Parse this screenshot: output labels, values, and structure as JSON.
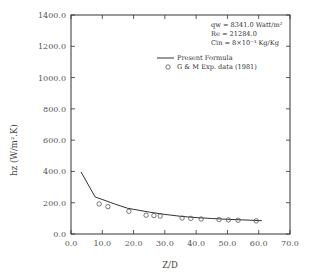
{
  "chart_data": {
    "type": "line",
    "title": "",
    "xlabel": "Z/D",
    "ylabel": "hz (W/m².K)",
    "xlim": [
      0,
      70
    ],
    "ylim": [
      0,
      1400
    ],
    "grid": false,
    "x_ticks": [
      "0.0",
      "10.0",
      "20.0",
      "30.0",
      "40.0",
      "50.0",
      "60.0",
      "70.0"
    ],
    "y_ticks": [
      "0.0",
      "200.0",
      "400.0",
      "600.0",
      "800.0",
      "1000.0",
      "1200.0",
      "1400.0"
    ],
    "legend_position": "upper right",
    "annotations": [
      {
        "name": "qw",
        "text": "qw  =  8341.0  Watt/m²"
      },
      {
        "name": "Re",
        "text": "Re  =  21284.0"
      },
      {
        "name": "Cin",
        "text": "Cin  =  8×10⁻³  Kg/Kg"
      }
    ],
    "series": [
      {
        "name": "Present Formula",
        "style": "line",
        "x": [
          3.2,
          7.7,
          14,
          18,
          25,
          30,
          35,
          40,
          45,
          50,
          55,
          61
        ],
        "y": [
          397,
          237,
          192,
          165,
          140,
          125,
          113,
          105,
          99,
          94,
          90,
          85
        ]
      },
      {
        "name": "G & M Exp. data (1981)",
        "style": "marker-circle-open",
        "x": [
          9,
          11.8,
          18.5,
          24,
          26.5,
          28.5,
          35.5,
          38.3,
          41.6,
          47.3,
          50.3,
          53.4,
          59.2
        ],
        "y": [
          192,
          175,
          145,
          120,
          118,
          115,
          102,
          100,
          96,
          92,
          90,
          88,
          84
        ]
      }
    ]
  },
  "legend": {
    "line_label": "Present Formula",
    "marker_label": "G & M Exp. data (1981)",
    "qw_text": "qw  =  8341.0  Watt/m²",
    "re_text": "Re  =  21284.0",
    "cin_text": "Cin  =  8×10⁻³  Kg/Kg"
  },
  "colors": {
    "axis": "#333333",
    "line": "#333333",
    "marker": "#555555",
    "text": "#444444"
  }
}
